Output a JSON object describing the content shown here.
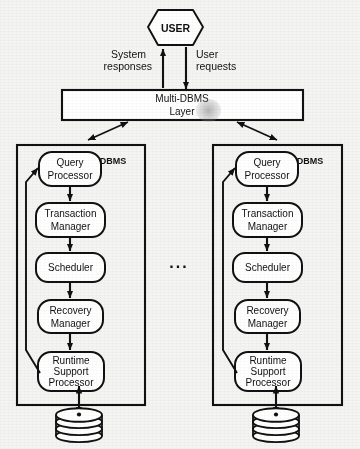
{
  "diagram": {
    "type": "block-diagram",
    "colors": {
      "stroke": "#111111",
      "background": "#f4f4f2",
      "fill": "#ffffff"
    },
    "user": {
      "label": "USER",
      "shape": "hexagon"
    },
    "flow_labels": {
      "system_responses": "System responses",
      "user_requests": "User requests"
    },
    "middleware": {
      "line1": "Multi-DBMS",
      "line2": "Layer",
      "shape": "rectangle"
    },
    "ellipsis": "...",
    "dbms_instances": [
      {
        "id": "dbms-left",
        "title": "DBMS",
        "components": [
          {
            "id": "query-processor",
            "line1": "Query",
            "line2": "Processor",
            "line3": ""
          },
          {
            "id": "transaction-manager",
            "line1": "Transaction",
            "line2": "Manager",
            "line3": ""
          },
          {
            "id": "scheduler",
            "line1": "Scheduler",
            "line2": "",
            "line3": ""
          },
          {
            "id": "recovery-manager",
            "line1": "Recovery",
            "line2": "Manager",
            "line3": ""
          },
          {
            "id": "runtime-support-processor",
            "line1": "Runtime",
            "line2": "Support",
            "line3": "Processor"
          }
        ],
        "database": {
          "id": "database-store",
          "shape": "cylinder-disk-pack",
          "label": ""
        }
      },
      {
        "id": "dbms-right",
        "title": "DBMS",
        "components": [
          {
            "id": "query-processor",
            "line1": "Query",
            "line2": "Processor",
            "line3": ""
          },
          {
            "id": "transaction-manager",
            "line1": "Transaction",
            "line2": "Manager",
            "line3": ""
          },
          {
            "id": "scheduler",
            "line1": "Scheduler",
            "line2": "",
            "line3": ""
          },
          {
            "id": "recovery-manager",
            "line1": "Recovery",
            "line2": "Manager",
            "line3": ""
          },
          {
            "id": "runtime-support-processor",
            "line1": "Runtime",
            "line2": "Support",
            "line3": "Processor"
          }
        ],
        "database": {
          "id": "database-store",
          "shape": "cylinder-disk-pack",
          "label": ""
        }
      }
    ]
  }
}
